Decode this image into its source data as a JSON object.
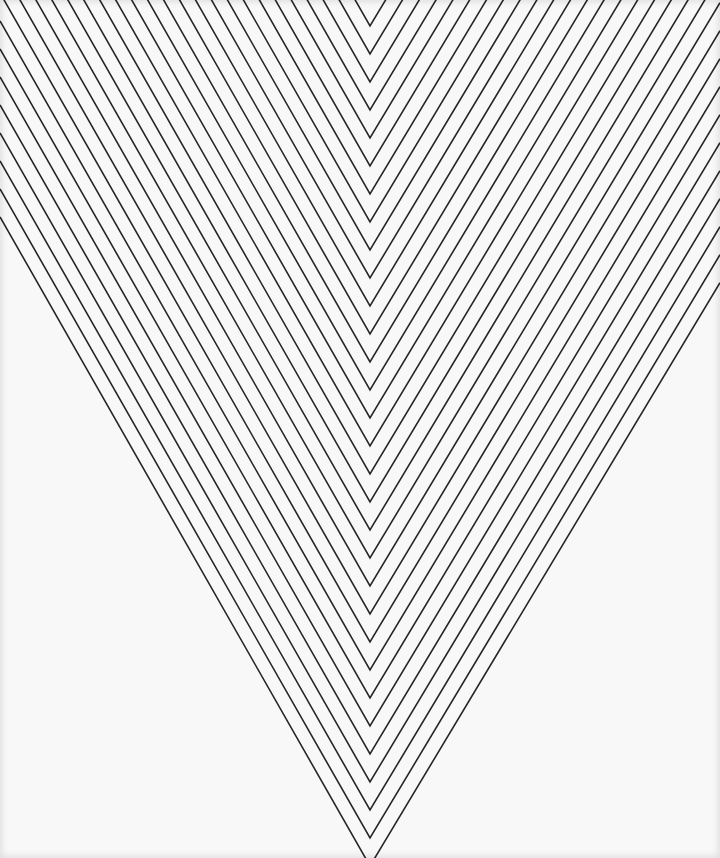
{
  "image": {
    "width": 720,
    "height": 858,
    "subject": "Black-and-white op-art chevron line pattern (nested downward-pointing V shapes)"
  },
  "pattern": {
    "type": "nested-chevrons",
    "orientation": "pointing-down",
    "apex_x": 370,
    "first_apex_y": 26,
    "vertical_spacing": 28,
    "left_dx_per_dy": 0.57,
    "right_dx_per_dy": 0.6,
    "line_width": 1.6,
    "colors": {
      "background": "#f8f8f8",
      "line": "#262626"
    }
  }
}
